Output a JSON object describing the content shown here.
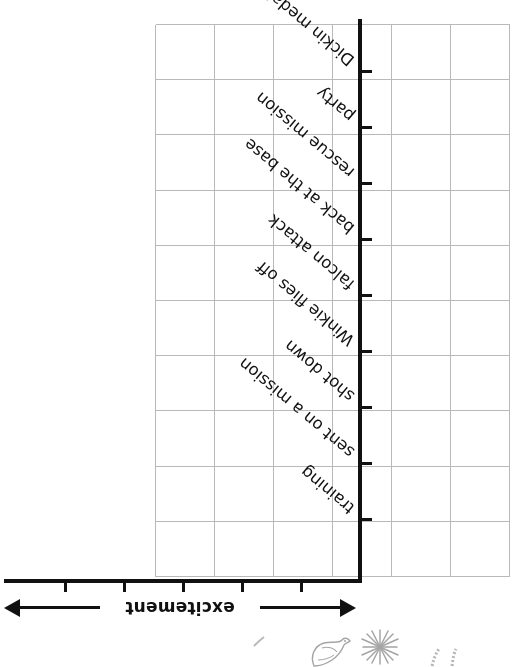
{
  "chart_data": {
    "type": "line",
    "title": "",
    "subtitle": "",
    "xlabel": "excitement",
    "ylabel": "",
    "grid": true,
    "legend": "none",
    "orientation": "rotated-180",
    "note": "blank plotting grid worksheet - no data plotted",
    "categories": [
      "training",
      "sent on a mission",
      "shot down",
      "Winkie flies off",
      "falcon attack",
      "back at the base",
      "rescue mission",
      "party",
      "Dickin medal"
    ],
    "values": [
      null,
      null,
      null,
      null,
      null,
      null,
      null,
      null,
      null
    ],
    "xlim": [
      0,
      6
    ],
    "ylim": [
      0,
      9
    ],
    "x_ticks": 5,
    "y_ticks": 9,
    "grid_columns": 6,
    "grid_rows": 10,
    "axis_color": "#111111",
    "grid_color": "#b9b9b9"
  },
  "axis": {
    "excitement_label": "excitement",
    "arrow_left": "arrow-left",
    "arrow_right": "arrow-right"
  },
  "decorations": [
    {
      "name": "pigeon-sketch"
    },
    {
      "name": "starburst-sketch"
    },
    {
      "name": "feather-marks-sketch"
    },
    {
      "name": "small-mark-sketch"
    }
  ]
}
